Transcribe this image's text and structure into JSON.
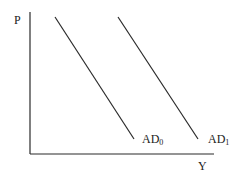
{
  "diagram": {
    "type": "aggregate-demand-shift",
    "axes": {
      "y_label": "P",
      "x_label": "Y"
    },
    "curves": [
      {
        "name": "AD",
        "subscript": "0",
        "x1": 55,
        "y1": 17,
        "x2": 134,
        "y2": 139
      },
      {
        "name": "AD",
        "subscript": "1",
        "x1": 118,
        "y1": 17,
        "x2": 198,
        "y2": 139
      }
    ],
    "line_color": "#2a2a2a"
  }
}
